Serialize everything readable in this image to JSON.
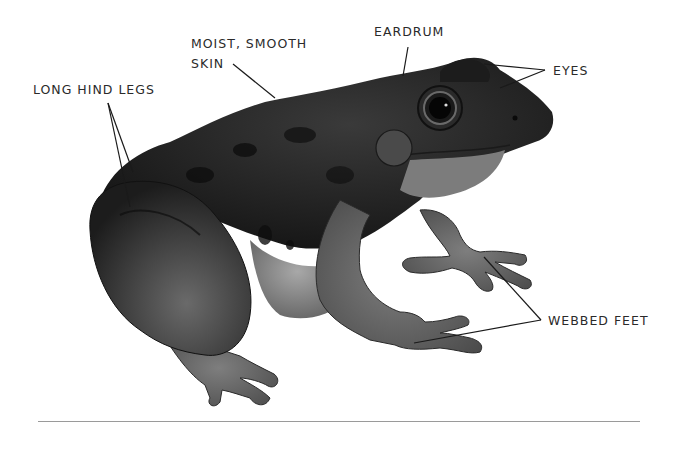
{
  "diagram": {
    "labels": {
      "moist_skin_line1": "MOIST, SMOOTH",
      "moist_skin_line2": "SKIN",
      "long_hind_legs": "LONG HIND LEGS",
      "eardrum": "EARDRUM",
      "eyes": "EYES",
      "webbed_feet": "WEBBED FEET"
    },
    "colors": {
      "background": "#ffffff",
      "label_text": "#2a2a2a",
      "leader_line": "#1a1a1a",
      "frog_dark": "#1e1e1e",
      "frog_mid": "#4a4a4a",
      "frog_light": "#8a8a8a",
      "rule": "#9a9a9a"
    }
  }
}
